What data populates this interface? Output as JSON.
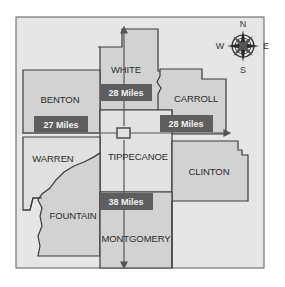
{
  "map": {
    "colors": {
      "page_bg": "#ffffff",
      "frame_bg": "#e6e6e6",
      "county_fill": "#d2d2d2",
      "county_light": "#e2e2e2",
      "border": "#3a3a3a",
      "distance_box": "#5e5e5e",
      "distance_text": "#f2f2f2",
      "arrow": "#555555"
    },
    "counties": [
      {
        "name": "WHITE"
      },
      {
        "name": "BENTON"
      },
      {
        "name": "CARROLL"
      },
      {
        "name": "WARREN"
      },
      {
        "name": "TIPPECANOE"
      },
      {
        "name": "CLINTON"
      },
      {
        "name": "FOUNTAIN"
      },
      {
        "name": "MONTGOMERY"
      }
    ],
    "distances": [
      {
        "direction": "north",
        "label": "28 Miles"
      },
      {
        "direction": "west",
        "label": "27 Miles"
      },
      {
        "direction": "east",
        "label": "28 Miles"
      },
      {
        "direction": "south",
        "label": "38 Miles"
      }
    ],
    "compass": {
      "n": "N",
      "s": "S",
      "e": "E",
      "w": "W"
    },
    "center_marker": "tippecanoe-center"
  }
}
